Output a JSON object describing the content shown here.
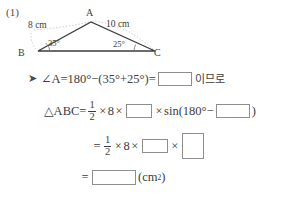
{
  "problem": {
    "number": "(1)"
  },
  "figure": {
    "type": "triangle",
    "vertices": {
      "A": "A",
      "B": "B",
      "C": "C"
    },
    "side_labels": {
      "AB": "8 cm",
      "AC": "10 cm"
    },
    "angle_labels": {
      "B": "35°",
      "C": "25°"
    },
    "icons": {
      "arc_ab": "dotted-arc-icon",
      "arc_ac": "dotted-arc-icon",
      "angle_mark_b": "angle-arc-icon",
      "angle_mark_c": "angle-arc-icon"
    }
  },
  "solution": {
    "arrow_icon": "right-arrow-icon",
    "line1": {
      "lhs": "∠A=180°−(35°+25°)=",
      "blank": "",
      "suffix_korean": "이므로"
    },
    "line2": {
      "lhs": "△ABC=",
      "frac_num": "1",
      "frac_den": "2",
      "times1": "×",
      "val1": "8",
      "times2": "×",
      "blank1": "",
      "times3": "×",
      "sin": "sin",
      "open_paren": "(",
      "inner": "180°−",
      "blank2": "",
      "close_paren": ")"
    },
    "line3": {
      "equals": "=",
      "frac_num": "1",
      "frac_den": "2",
      "times1": "×",
      "val1": "8",
      "times2": "×",
      "blank1": "",
      "times3": "×",
      "blank2": ""
    },
    "line4": {
      "equals": "=",
      "blank": "",
      "unit_open": "(cm",
      "unit_sup": "2",
      "unit_close": ")"
    }
  },
  "colors": {
    "ink": "#3d3d3d",
    "box_border": "#8e8e8e",
    "dotted": "#b5b5b5",
    "background": "#ffffff"
  }
}
